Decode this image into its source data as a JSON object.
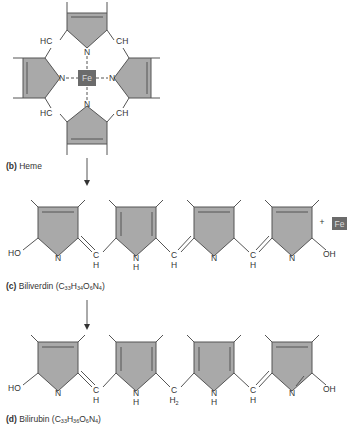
{
  "panels": {
    "heme": {
      "letter": "(b)",
      "name": "Heme",
      "center_atom": "Fe",
      "labels": {
        "hc_top": "HC",
        "ch_top": "CH",
        "hc_bottom": "HC",
        "ch_bottom": "CH",
        "n": "N"
      }
    },
    "biliverdin": {
      "letter": "(c)",
      "name": "Biliverdin",
      "formula": {
        "C": "33",
        "H": "34",
        "O": "6",
        "N": "4"
      },
      "plus": "+",
      "fe": "Fe",
      "ho": "HO",
      "oh": "OH",
      "n": "N",
      "nh": "NH",
      "c": "C",
      "h": "H"
    },
    "bilirubin": {
      "letter": "(d)",
      "name": "Bilirubin",
      "formula": {
        "C": "33",
        "H": "36",
        "O": "6",
        "N": "4"
      },
      "ho": "HO",
      "oh": "OH",
      "n": "N",
      "h": "H",
      "c": "C",
      "h2": "H2"
    }
  },
  "colors": {
    "ring_fill": "#a9a9a9",
    "ring_stroke": "#555555",
    "fe_box": "#6b6b6b",
    "text": "#333333"
  }
}
